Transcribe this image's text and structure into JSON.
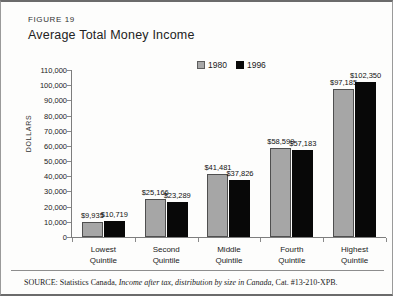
{
  "figure": {
    "label": "FIGURE 19",
    "title": "Average Total Money Income"
  },
  "legend": {
    "items": [
      {
        "label": "1980",
        "color": "#a6a6a6",
        "swatch": "gray-square-swatch"
      },
      {
        "label": "1996",
        "color": "#080808",
        "swatch": "black-square-swatch"
      }
    ]
  },
  "axis": {
    "y_title": "DOLLARS",
    "y_ticks": [
      "0",
      "10,000",
      "20,000",
      "30,000",
      "40,000",
      "50,000",
      "60,000",
      "70,000",
      "80,000",
      "90,000",
      "100,000",
      "110,000"
    ]
  },
  "source": {
    "prefix": "SOURCE:",
    "agency": "Statistics Canada,",
    "publication": "Income after tax, distribution by size in Canada,",
    "catalogue": "Cat. #13-210-XPB."
  },
  "chart_data": {
    "type": "bar",
    "title": "Average Total Money Income",
    "xlabel": "",
    "ylabel": "DOLLARS",
    "ylim": [
      0,
      110000
    ],
    "ytick_step": 10000,
    "grid": false,
    "legend_position": "top-center",
    "categories": [
      "Lowest Quintile",
      "Second Quintile",
      "Middle Quintile",
      "Fourth Quintile",
      "Highest Quintile"
    ],
    "category_lines": [
      [
        "Lowest",
        "Quintile"
      ],
      [
        "Second",
        "Quintile"
      ],
      [
        "Middle",
        "Quintile"
      ],
      [
        "Fourth",
        "Quintile"
      ],
      [
        "Highest",
        "Quintile"
      ]
    ],
    "series": [
      {
        "name": "1980",
        "color": "#a6a6a6",
        "values": [
          9935,
          25166,
          41481,
          58599,
          97185
        ],
        "labels": [
          "$9,935",
          "$25,166",
          "$41,481",
          "$58,599",
          "$97,185"
        ]
      },
      {
        "name": "1996",
        "color": "#080808",
        "values": [
          10719,
          23289,
          37826,
          57183,
          102350
        ],
        "labels": [
          "$10,719",
          "$23,289",
          "$37,826",
          "$57,183",
          "$102,350"
        ]
      }
    ]
  }
}
